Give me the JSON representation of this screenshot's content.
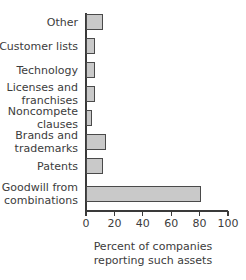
{
  "chart_data": {
    "type": "bar",
    "orientation": "horizontal",
    "title": "",
    "subtitle": "",
    "xlabel": "Percent of companies\nreporting such assets",
    "ylabel": "",
    "xlim": [
      0,
      100
    ],
    "xticks": [
      0,
      20,
      40,
      60,
      80,
      100
    ],
    "xtick_labels": [
      "0",
      "20",
      "40",
      "60",
      "80",
      "100"
    ],
    "grid": false,
    "legend": null,
    "legend_position": "none",
    "bar_fill_color": "#c9c9c9",
    "bar_edge_color": "#4a4a4a",
    "axis_color": "#3a3a3a",
    "categories": [
      "Other",
      "Customer lists",
      "Technology",
      "Licenses and\nfranchises",
      "Noncompete\nclauses",
      "Brands and\ntrademarks",
      "Patents",
      "Goodwill from\ncombinations"
    ],
    "values": [
      12,
      6,
      6,
      6,
      4,
      14,
      12,
      81
    ],
    "value_unit": "percent"
  }
}
